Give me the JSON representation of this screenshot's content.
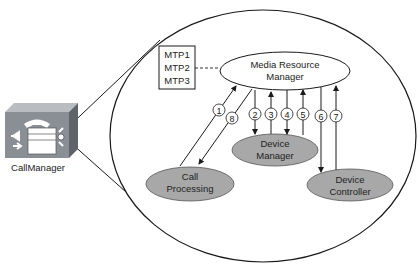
{
  "icon": {
    "name": "callmanager-server-icon",
    "label": "CallManager"
  },
  "mtp_box": {
    "lines": [
      "MTP1",
      "MTP2",
      "MTP3"
    ]
  },
  "nodes": {
    "mrm": {
      "line1": "Media Resource",
      "line2": "Manager"
    },
    "device_manager": {
      "line1": "Device",
      "line2": "Manager"
    },
    "call_processing": {
      "line1": "Call",
      "line2": "Processing"
    },
    "device_controller": {
      "line1": "Device",
      "line2": "Controller"
    }
  },
  "steps": [
    "1",
    "2",
    "3",
    "4",
    "5",
    "6",
    "7",
    "8"
  ],
  "colors": {
    "node_fill": "#a8a8a8",
    "icon_front": "#8a8f96",
    "icon_top": "#b9bdc2",
    "stroke": "#1a1a1a"
  }
}
